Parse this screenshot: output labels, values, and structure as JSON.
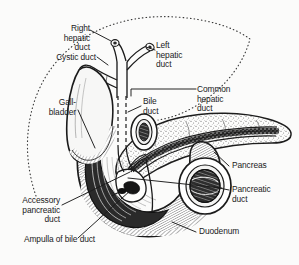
{
  "figure": {
    "style": "black and white line drawing",
    "background_color": "#fbfbfa",
    "ink_color": "#1a1a1a"
  },
  "labels": {
    "right_hepatic_duct": "Right\nhepatic\nduct",
    "left_hepatic_duct": "Left\nhepatic\nduct",
    "cystic_duct": "Cystic duct",
    "common_hepatic_duct": "Common\nhepatic\nduct",
    "bile_duct": "Bile\nduct",
    "gallbladder": "Gall-\nbladder",
    "pancreas": "Pancreas",
    "pancreatic_duct": "Pancreatic\nduct",
    "accessory_pancreatic_duct": "Accessory\npancreatic\nduct",
    "ampulla_of_bile_duct": "Ampulla of bile duct",
    "duodenum": "Duodenum"
  },
  "structures": [
    {
      "name": "liver-outline",
      "rendering": "dotted contour"
    },
    {
      "name": "gallbladder",
      "rendering": "pear shaped sac, stippled rim"
    },
    {
      "name": "cystic-duct",
      "rendering": "narrow tube"
    },
    {
      "name": "right-hepatic-duct",
      "rendering": "branch tube"
    },
    {
      "name": "left-hepatic-duct",
      "rendering": "branch tube"
    },
    {
      "name": "common-hepatic-duct",
      "rendering": "vertical tube"
    },
    {
      "name": "bile-duct",
      "rendering": "dashed hidden tube"
    },
    {
      "name": "pancreas",
      "rendering": "lobular stippled gland"
    },
    {
      "name": "pancreatic-duct",
      "rendering": "dark branching duct"
    },
    {
      "name": "accessory-pancreatic-duct",
      "rendering": "small duct"
    },
    {
      "name": "ampulla-of-bile-duct",
      "rendering": "dilated junction"
    },
    {
      "name": "duodenum",
      "rendering": "C-shaped loop, hatched wall, cut open"
    }
  ]
}
